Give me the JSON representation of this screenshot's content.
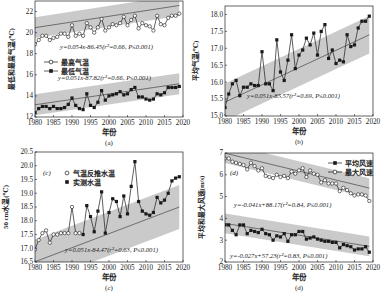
{
  "chart_data": [
    {
      "id": "a",
      "type": "line",
      "caption": "(a)",
      "xlabel": "年份",
      "ylabel": "最低和最高气温(℃)",
      "xlim": [
        1980,
        2020
      ],
      "ylim": [
        12,
        23
      ],
      "xticks": [
        1980,
        1985,
        1990,
        1995,
        2000,
        2005,
        2010,
        2015,
        2020
      ],
      "yticks": [
        12,
        14,
        16,
        18,
        20,
        22
      ],
      "x": [
        1980,
        1981,
        1982,
        1983,
        1984,
        1985,
        1986,
        1987,
        1988,
        1989,
        1990,
        1991,
        1992,
        1993,
        1994,
        1995,
        1996,
        1997,
        1998,
        1999,
        2000,
        2001,
        2002,
        2003,
        2004,
        2005,
        2006,
        2007,
        2008,
        2009,
        2010,
        2011,
        2012,
        2013,
        2014,
        2015,
        2016,
        2017,
        2018,
        2019
      ],
      "series": [
        {
          "name": "最高气温",
          "marker": "open-circle",
          "values": [
            18.9,
            19.3,
            19.7,
            19.7,
            19.3,
            19.5,
            19.6,
            19.9,
            19.9,
            19.6,
            20.7,
            19.7,
            19.9,
            19.7,
            20.9,
            20.5,
            20.0,
            20.5,
            21.3,
            20.2,
            20.5,
            20.8,
            20.7,
            20.9,
            21.5,
            20.7,
            21.2,
            21.6,
            20.4,
            20.9,
            20.7,
            20.6,
            20.2,
            21.6,
            20.8,
            20.7,
            21.4,
            21.6,
            21.6,
            21.8
          ],
          "trend": {
            "slope": 0.054,
            "intercept": -86.45,
            "label": "y=0.054x-86.45(r²=0.66, P≤0.001)"
          }
        },
        {
          "name": "最低气温",
          "marker": "filled-square",
          "values": [
            12.4,
            12.8,
            13.0,
            13.0,
            12.8,
            13.0,
            12.8,
            12.8,
            12.9,
            13.2,
            13.8,
            13.1,
            12.8,
            12.7,
            14.2,
            13.1,
            12.9,
            13.4,
            14.5,
            13.6,
            14.0,
            14.1,
            14.2,
            14.4,
            14.1,
            14.2,
            14.6,
            14.8,
            13.9,
            13.9,
            13.7,
            13.6,
            13.7,
            14.2,
            14.1,
            14.3,
            14.8,
            14.8,
            14.8,
            14.9
          ],
          "trend": {
            "slope": 0.051,
            "intercept": -87.82,
            "label": "y=0.051x-87.82(r²=0.66, P≤0.001)"
          }
        }
      ],
      "confidence_band": true,
      "legend_position": "middle-left",
      "grid": false
    },
    {
      "id": "b",
      "type": "line",
      "caption": "(b)",
      "xlabel": "年份",
      "ylabel": "平均气温(℃)",
      "xlim": [
        1980,
        2020
      ],
      "ylim": [
        15.0,
        18.25
      ],
      "xticks": [
        1980,
        1985,
        1990,
        1995,
        2000,
        2005,
        2010,
        2015,
        2020
      ],
      "yticks": [
        15.0,
        15.5,
        16.0,
        16.5,
        17.0,
        17.5,
        18.0
      ],
      "x": [
        1980,
        1981,
        1982,
        1983,
        1984,
        1985,
        1986,
        1987,
        1988,
        1989,
        1990,
        1991,
        1992,
        1993,
        1994,
        1995,
        1996,
        1997,
        1998,
        1999,
        2000,
        2001,
        2002,
        2003,
        2004,
        2005,
        2006,
        2007,
        2008,
        2009,
        2010,
        2011,
        2012,
        2013,
        2014,
        2015,
        2016,
        2017,
        2018,
        2019
      ],
      "series": [
        {
          "name": "平均气温",
          "marker": "filled-square",
          "values": [
            15.25,
            15.65,
            15.95,
            16.05,
            15.6,
            15.85,
            15.85,
            15.95,
            15.9,
            15.9,
            16.9,
            15.95,
            15.95,
            15.75,
            17.25,
            16.3,
            16.05,
            16.65,
            17.4,
            16.4,
            16.8,
            16.95,
            17.3,
            17.1,
            17.45,
            16.8,
            17.5,
            17.7,
            16.7,
            16.95,
            16.55,
            16.65,
            16.6,
            17.4,
            17.05,
            17.1,
            17.6,
            17.8,
            17.8,
            17.95
          ],
          "trend": {
            "slope": 0.051,
            "intercept": -85.57,
            "label": "y=0.051x-85.57(r²=0.69, P≤0.001)"
          }
        }
      ],
      "confidence_band": true,
      "grid": false
    },
    {
      "id": "c",
      "type": "line",
      "caption": "(c)",
      "panel_label": "(c)",
      "xlabel": "年份",
      "ylabel": "50 cm水温(℃)",
      "xlim": [
        1980,
        2020
      ],
      "ylim": [
        16.5,
        20.5
      ],
      "xticks": [
        1980,
        1985,
        1990,
        1995,
        2000,
        2005,
        2010,
        2015,
        2020
      ],
      "yticks": [
        16.5,
        17.0,
        17.5,
        18.0,
        18.5,
        19.0,
        19.5,
        20.0,
        20.5
      ],
      "series": [
        {
          "name": "气温反推水温",
          "marker": "open-circle",
          "x": [
            1980,
            1981,
            1982,
            1983,
            1984,
            1985,
            1986,
            1987,
            1988,
            1989,
            1990,
            1991,
            1992
          ],
          "values": [
            16.95,
            17.3,
            17.55,
            17.65,
            17.2,
            17.5,
            17.5,
            17.55,
            17.55,
            17.55,
            18.5,
            17.55,
            17.55
          ]
        },
        {
          "name": "实测水温",
          "marker": "filled-square",
          "x": [
            1993,
            1994,
            1995,
            1996,
            1997,
            1998,
            1999,
            2000,
            2001,
            2002,
            2003,
            2004,
            2005,
            2006,
            2007,
            2008,
            2009,
            2010,
            2011,
            2012,
            2013,
            2014,
            2015,
            2016,
            2017,
            2018,
            2019
          ],
          "values": [
            17.5,
            18.55,
            18.15,
            17.6,
            18.35,
            19.05,
            17.55,
            18.3,
            18.8,
            18.7,
            18.15,
            18.9,
            18.25,
            19.25,
            20.15,
            18.7,
            18.35,
            18.25,
            18.2,
            18.3,
            18.85,
            18.65,
            18.75,
            19.0,
            19.45,
            19.55,
            19.6
          ]
        }
      ],
      "trend": {
        "slope": 0.051,
        "intercept": -84.47,
        "label": "y=0.051x-84.47(r²=0.63, P≤0.001)"
      },
      "confidence_band": true,
      "legend_position": "upper-left",
      "grid": false
    },
    {
      "id": "d",
      "type": "line",
      "caption": "(d)",
      "panel_label": "(d)",
      "xlabel": "年份",
      "ylabel": "平均和最大风速(m/s)",
      "xlim": [
        1980,
        2020
      ],
      "ylim": [
        2,
        7
      ],
      "xticks": [
        1980,
        1985,
        1990,
        1995,
        2000,
        2005,
        2010,
        2015,
        2020
      ],
      "yticks": [
        2,
        3,
        4,
        5,
        6,
        7
      ],
      "x": [
        1980,
        1981,
        1982,
        1983,
        1984,
        1985,
        1986,
        1987,
        1988,
        1989,
        1990,
        1991,
        1992,
        1993,
        1994,
        1995,
        1996,
        1997,
        1998,
        1999,
        2000,
        2001,
        2002,
        2003,
        2004,
        2005,
        2006,
        2007,
        2008,
        2009,
        2010,
        2011,
        2012,
        2013,
        2014,
        2015,
        2016,
        2017,
        2018,
        2019
      ],
      "series": [
        {
          "name": "平均风速",
          "marker": "filled-square",
          "values": [
            3.7,
            3.7,
            3.45,
            3.25,
            3.7,
            3.7,
            3.3,
            3.45,
            3.4,
            3.35,
            3.5,
            3.3,
            3.25,
            3.0,
            3.2,
            3.15,
            3.3,
            2.95,
            3.25,
            3.25,
            3.4,
            3.4,
            3.05,
            3.1,
            3.15,
            3.05,
            3.0,
            2.95,
            2.95,
            2.9,
            2.9,
            2.65,
            2.8,
            2.75,
            2.7,
            2.55,
            2.6,
            2.6,
            2.7,
            2.45
          ],
          "trend": {
            "slope": -0.027,
            "intercept": 57.23,
            "label": "y=-0.027x+57.23(r²=0.83, P≤0.001)"
          }
        },
        {
          "name": "最大风速",
          "marker": "open-circle",
          "values": [
            6.75,
            6.75,
            6.6,
            6.55,
            6.5,
            6.45,
            6.25,
            6.55,
            6.4,
            6.2,
            6.3,
            5.95,
            5.9,
            5.85,
            6.0,
            5.9,
            5.95,
            5.85,
            6.15,
            6.05,
            6.2,
            6.3,
            5.9,
            6.2,
            6.05,
            6.0,
            5.65,
            5.75,
            5.6,
            5.6,
            5.6,
            5.25,
            5.4,
            5.3,
            5.15,
            5.05,
            5.1,
            5.1,
            5.05,
            4.8
          ],
          "trend": {
            "slope": -0.041,
            "intercept": 88.17,
            "label": "y=-0.041x+88.17(r²=0.84, P≤0.001)"
          }
        }
      ],
      "confidence_band": true,
      "legend_position": "upper-right",
      "grid": false
    }
  ],
  "colors": {
    "band": "#c4c4c4",
    "line": "#1a1a1a",
    "trend": "#555555",
    "axis": "#222222"
  }
}
